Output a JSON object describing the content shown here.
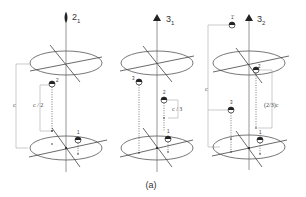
{
  "figure": {
    "caption": "(a)",
    "panels": [
      {
        "axis_symbol": "2",
        "axis_subscript": "1",
        "symbol_shape": "lens (two-fold)",
        "height_label": "c",
        "step_label": "c / 2",
        "atom_labels": [
          "1",
          "2"
        ]
      },
      {
        "axis_symbol": "3",
        "axis_subscript": "1",
        "symbol_shape": "triangle (three-fold)",
        "step_label": "c / 3",
        "atom_labels": [
          "1",
          "2",
          "3"
        ]
      },
      {
        "axis_symbol": "3",
        "axis_subscript": "2",
        "symbol_shape": "triangle (three-fold)",
        "height_label": "c",
        "step_label": "(2/3)c",
        "atom_labels": [
          "1",
          "2",
          "3",
          "1'"
        ]
      }
    ]
  }
}
